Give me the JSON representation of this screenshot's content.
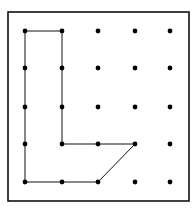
{
  "diagram": {
    "type": "geoboard",
    "grid": {
      "columns": 5,
      "rows": 5
    },
    "col_x": [
      25,
      62,
      98,
      135,
      170
    ],
    "row_y": [
      31,
      68,
      107,
      144,
      182
    ],
    "frame": {
      "x": 8,
      "y": 12,
      "width": 181,
      "height": 189
    },
    "polygon_vertices": [
      [
        0,
        0
      ],
      [
        1,
        0
      ],
      [
        1,
        3
      ],
      [
        3,
        3
      ],
      [
        2,
        4
      ],
      [
        0,
        4
      ]
    ],
    "colors": {
      "stroke": "#111111",
      "dot": "#000000",
      "background": "#ffffff"
    }
  }
}
